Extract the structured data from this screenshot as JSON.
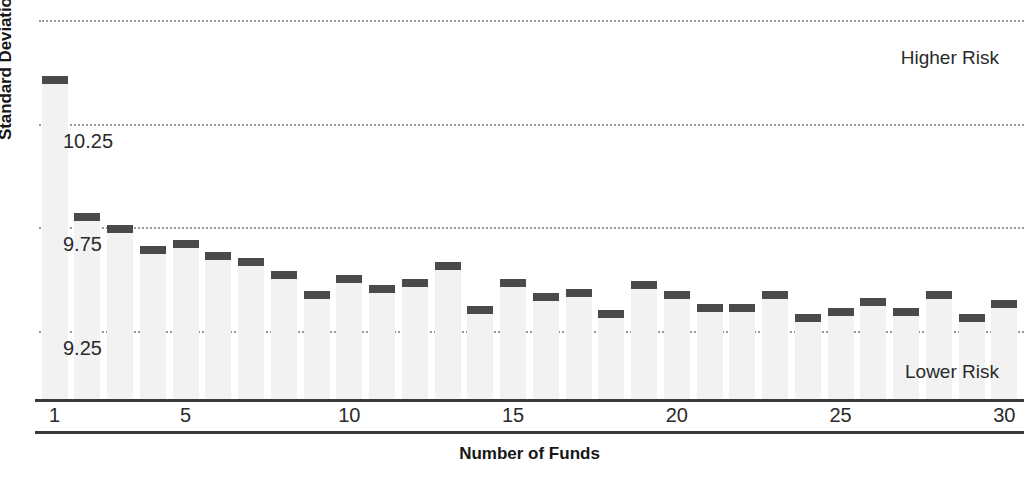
{
  "chart_data": {
    "type": "bar",
    "title": "",
    "xlabel": "Number of Funds",
    "ylabel": "Standard Deviation",
    "xlim": [
      0.4,
      30.6
    ],
    "ylim": [
      8.92,
      10.8
    ],
    "grid": true,
    "gridlines": [
      10.75,
      10.25,
      9.75,
      9.25
    ],
    "ytick_labels": [
      "10.25",
      "9.75",
      "9.25"
    ],
    "ytick_values": [
      10.25,
      9.75,
      9.25
    ],
    "xtick_labels": [
      "1",
      "5",
      "10",
      "15",
      "20",
      "25",
      "30"
    ],
    "xtick_values": [
      1,
      5,
      10,
      15,
      20,
      25,
      30
    ],
    "categories": [
      1,
      2,
      3,
      4,
      5,
      6,
      7,
      8,
      9,
      10,
      11,
      12,
      13,
      14,
      15,
      16,
      17,
      18,
      19,
      20,
      21,
      22,
      23,
      24,
      25,
      26,
      27,
      28,
      29,
      30
    ],
    "values": [
      10.48,
      9.82,
      9.76,
      9.66,
      9.69,
      9.63,
      9.6,
      9.54,
      9.44,
      9.52,
      9.47,
      9.5,
      9.58,
      9.37,
      9.5,
      9.43,
      9.45,
      9.35,
      9.49,
      9.44,
      9.38,
      9.38,
      9.44,
      9.33,
      9.36,
      9.41,
      9.36,
      9.44,
      9.33,
      9.4
    ],
    "annotations": [
      {
        "text": "Higher Risk",
        "position": "top-right"
      },
      {
        "text": "Lower Risk",
        "position": "bottom-right"
      }
    ],
    "bar_color": "#f2f2f2",
    "cap_color": "#4a4a4a",
    "grid_color": "#9a9a9a",
    "axis_color": "#3a3a3a"
  }
}
